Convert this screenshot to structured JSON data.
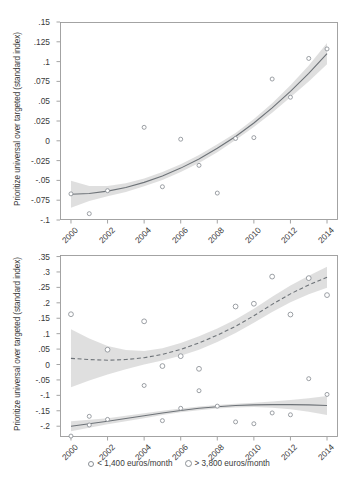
{
  "figure": {
    "ylabel": "Prioritize universal over targeted (standard index)",
    "xlabel": ""
  },
  "legend": {
    "items": [
      {
        "label": "< 1,400 euros/month",
        "marker": "small-circle-marker",
        "color": "#8a8f95"
      },
      {
        "label": "> 3,800 euros/month",
        "marker": "circle-marker",
        "color": "#8a8f95"
      }
    ]
  },
  "colors": {
    "line": "#6e7378",
    "band": "#d9d9d9",
    "marker_edge": "#8a8f95",
    "axis": "#9a9a9a",
    "text": "#3a3a3a"
  },
  "chart_data": [
    {
      "type": "scatter",
      "panel": "top",
      "title": "",
      "xlabel": "",
      "ylabel": "Prioritize universal over targeted (standard index)",
      "xlim": [
        1999.4,
        2014.6
      ],
      "ylim": [
        -0.1,
        0.15
      ],
      "xticks": [
        2000,
        2002,
        2004,
        2006,
        2008,
        2010,
        2012,
        2014
      ],
      "xticklabels": [
        "2000",
        "2002",
        "2004",
        "2006",
        "2008",
        "2010",
        "2012",
        "2014"
      ],
      "yticks": [
        -0.1,
        -0.075,
        -0.05,
        -0.025,
        0,
        0.025,
        0.05,
        0.075,
        0.1,
        0.125,
        0.15
      ],
      "yticklabels": [
        "-.1",
        "-.075",
        "-.05",
        "-.025",
        "0",
        ".025",
        ".05",
        ".075",
        ".1",
        ".125",
        ".15"
      ],
      "grid": false,
      "legend_position": "none",
      "series": [
        {
          "name": "all",
          "style": "solid",
          "marker": "open-circle",
          "x": [
            2000,
            2001,
            2002,
            2004,
            2005,
            2006,
            2007,
            2008,
            2009,
            2010,
            2011,
            2012,
            2013,
            2014
          ],
          "values": [
            -0.067,
            -0.092,
            -0.063,
            0.017,
            -0.058,
            0.002,
            -0.031,
            -0.066,
            0.003,
            0.004,
            0.078,
            0.055,
            0.104,
            0.116
          ]
        }
      ],
      "fit": {
        "style": "solid",
        "x": [
          2000,
          2001,
          2002,
          2003,
          2004,
          2005,
          2006,
          2007,
          2008,
          2009,
          2010,
          2011,
          2012,
          2013,
          2014
        ],
        "y": [
          -0.0675,
          -0.0665,
          -0.0635,
          -0.059,
          -0.0525,
          -0.0445,
          -0.0345,
          -0.023,
          -0.0095,
          0.0055,
          0.0225,
          0.0415,
          0.0625,
          0.085,
          0.11
        ],
        "ci_lower": [
          -0.0845,
          -0.076,
          -0.07,
          -0.0645,
          -0.0575,
          -0.0495,
          -0.0395,
          -0.028,
          -0.0145,
          0.001,
          0.0175,
          0.0355,
          0.055,
          0.075,
          0.0965
        ],
        "ci_upper": [
          -0.0505,
          -0.057,
          -0.057,
          -0.0535,
          -0.0475,
          -0.0395,
          -0.0295,
          -0.018,
          -0.0045,
          0.01,
          0.0275,
          0.0475,
          0.07,
          0.095,
          0.1235
        ]
      }
    },
    {
      "type": "scatter",
      "panel": "bottom",
      "title": "",
      "xlabel": "",
      "ylabel": "Prioritize universal over targeted (standard index)",
      "xlim": [
        1999.4,
        2014.6
      ],
      "ylim": [
        -0.235,
        0.355
      ],
      "xticks": [
        2000,
        2002,
        2004,
        2006,
        2008,
        2010,
        2012,
        2014
      ],
      "xticklabels": [
        "2000",
        "2002",
        "2004",
        "2006",
        "2008",
        "2010",
        "2012",
        "2014"
      ],
      "yticks": [
        -0.2,
        -0.15,
        -0.1,
        -0.05,
        0,
        0.05,
        0.1,
        0.15,
        0.2,
        0.25,
        0.3,
        0.35
      ],
      "yticklabels": [
        "-.2",
        "-.15",
        "-.1",
        "-.05",
        "0",
        ".05",
        ".1",
        ".15",
        ".2",
        ".25",
        ".3",
        ".35"
      ],
      "grid": false,
      "legend_position": "bottom",
      "series": [
        {
          "name": "< 1,400 euros/month",
          "style": "solid",
          "marker": "open-circle",
          "x": [
            2000,
            2001,
            2001,
            2002,
            2004,
            2005,
            2006,
            2007,
            2008,
            2009,
            2010,
            2011,
            2012,
            2013,
            2014
          ],
          "values": [
            -0.232,
            -0.196,
            -0.168,
            -0.178,
            -0.068,
            -0.182,
            -0.142,
            -0.085,
            -0.135,
            -0.186,
            -0.192,
            -0.157,
            -0.163,
            -0.046,
            -0.097
          ]
        },
        {
          "name": "> 3,800 euros/month",
          "style": "dashed",
          "marker": "open-circle",
          "x": [
            2000,
            2002,
            2004,
            2005,
            2006,
            2007,
            2009,
            2010,
            2011,
            2012,
            2013,
            2014
          ],
          "values": [
            0.163,
            0.048,
            0.14,
            -0.005,
            0.027,
            -0.014,
            0.188,
            0.197,
            0.285,
            0.162,
            0.28,
            0.225
          ]
        }
      ],
      "fit": [
        {
          "name": "< 1,400 euros/month",
          "style": "solid",
          "x": [
            2000,
            2001,
            2002,
            2003,
            2004,
            2005,
            2006,
            2007,
            2008,
            2009,
            2010,
            2011,
            2012,
            2013,
            2014
          ],
          "y": [
            -0.2,
            -0.192,
            -0.184,
            -0.175,
            -0.166,
            -0.157,
            -0.149,
            -0.142,
            -0.137,
            -0.133,
            -0.131,
            -0.13,
            -0.13,
            -0.131,
            -0.133
          ],
          "ci_lower": [
            -0.216,
            -0.205,
            -0.194,
            -0.184,
            -0.174,
            -0.164,
            -0.155,
            -0.148,
            -0.143,
            -0.139,
            -0.138,
            -0.14,
            -0.145,
            -0.153,
            -0.164
          ],
          "ci_upper": [
            -0.184,
            -0.179,
            -0.174,
            -0.166,
            -0.158,
            -0.15,
            -0.143,
            -0.136,
            -0.131,
            -0.127,
            -0.124,
            -0.12,
            -0.115,
            -0.109,
            -0.102
          ]
        },
        {
          "name": "> 3,800 euros/month",
          "style": "dashed",
          "x": [
            2000,
            2001,
            2002,
            2003,
            2004,
            2005,
            2006,
            2007,
            2008,
            2009,
            2010,
            2011,
            2012,
            2013,
            2014
          ],
          "y": [
            0.02,
            0.016,
            0.014,
            0.016,
            0.022,
            0.033,
            0.049,
            0.07,
            0.095,
            0.124,
            0.158,
            0.195,
            0.229,
            0.258,
            0.283
          ],
          "ci_lower": [
            -0.074,
            -0.052,
            -0.032,
            -0.015,
            0.0,
            0.013,
            0.028,
            0.048,
            0.073,
            0.102,
            0.135,
            0.17,
            0.202,
            0.228,
            0.249
          ],
          "ci_upper": [
            0.114,
            0.084,
            0.06,
            0.047,
            0.044,
            0.053,
            0.07,
            0.092,
            0.117,
            0.146,
            0.181,
            0.22,
            0.256,
            0.288,
            0.317
          ]
        }
      ]
    }
  ]
}
